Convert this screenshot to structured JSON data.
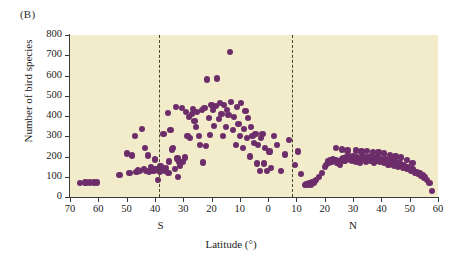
{
  "panel": {
    "label": "(B)"
  },
  "chart_data": {
    "type": "scatter",
    "title": "",
    "xlabel": "Latitude (°)",
    "ylabel": "Number of bird species",
    "xlim": [
      -70,
      60
    ],
    "ylim": [
      0,
      800
    ],
    "grid": false,
    "legend": null,
    "y_ticks": [
      0,
      100,
      200,
      300,
      400,
      500,
      600,
      700,
      800
    ],
    "x_ticks": [
      {
        "value": -70,
        "label": "70"
      },
      {
        "value": -60,
        "label": "60"
      },
      {
        "value": -50,
        "label": "50"
      },
      {
        "value": -40,
        "label": "40"
      },
      {
        "value": -30,
        "label": "30"
      },
      {
        "value": -20,
        "label": "20"
      },
      {
        "value": -10,
        "label": "10"
      },
      {
        "value": 0,
        "label": "0"
      },
      {
        "value": 10,
        "label": "10"
      },
      {
        "value": 20,
        "label": "20"
      },
      {
        "value": 30,
        "label": "30"
      },
      {
        "value": 40,
        "label": "40"
      },
      {
        "value": 50,
        "label": "50"
      },
      {
        "value": 60,
        "label": "60"
      }
    ],
    "hemisphere_labels": [
      {
        "text": "S",
        "value": -38
      },
      {
        "text": "N",
        "value": 30
      }
    ],
    "annotations": [
      {
        "type": "vline",
        "name": "tropic-south-line",
        "value": -38.5,
        "style": "dashed"
      },
      {
        "type": "vline",
        "name": "tropic-north-line",
        "value": 8.5,
        "style": "dashed"
      }
    ],
    "marker_color": "#6d2d6b",
    "plot_background": "#f3ecca",
    "points": [
      [
        -66.5,
        70
      ],
      [
        -64.5,
        72
      ],
      [
        -63.0,
        72
      ],
      [
        -61.5,
        72
      ],
      [
        -60.5,
        72
      ],
      [
        -52.5,
        108
      ],
      [
        -50.0,
        215
      ],
      [
        -49.0,
        118
      ],
      [
        -48.0,
        205
      ],
      [
        -47.0,
        300
      ],
      [
        -46.5,
        122
      ],
      [
        -46.0,
        135
      ],
      [
        -45.2,
        128
      ],
      [
        -44.5,
        335
      ],
      [
        -44.0,
        140
      ],
      [
        -43.5,
        240
      ],
      [
        -43.0,
        130
      ],
      [
        -42.5,
        205
      ],
      [
        -42.0,
        122
      ],
      [
        -41.5,
        150
      ],
      [
        -41.0,
        135
      ],
      [
        -40.5,
        128
      ],
      [
        -40.0,
        185
      ],
      [
        -39.8,
        140
      ],
      [
        -39.5,
        132
      ],
      [
        -39.0,
        85
      ],
      [
        -38.8,
        138
      ],
      [
        -38.5,
        130
      ],
      [
        -38.2,
        125
      ],
      [
        -38.0,
        155
      ],
      [
        -37.5,
        145
      ],
      [
        -37.2,
        132
      ],
      [
        -37.0,
        310
      ],
      [
        -36.5,
        128
      ],
      [
        -36.0,
        142
      ],
      [
        -35.5,
        415
      ],
      [
        -35.2,
        120
      ],
      [
        -35.0,
        175
      ],
      [
        -34.5,
        330
      ],
      [
        -34.0,
        235
      ],
      [
        -33.5,
        240
      ],
      [
        -33.0,
        140
      ],
      [
        -32.5,
        445
      ],
      [
        -32.0,
        190
      ],
      [
        -31.8,
        100
      ],
      [
        -31.5,
        175
      ],
      [
        -31.0,
        155
      ],
      [
        -30.5,
        440
      ],
      [
        -30.0,
        172
      ],
      [
        -29.5,
        195
      ],
      [
        -29.0,
        420
      ],
      [
        -28.5,
        300
      ],
      [
        -28.0,
        395
      ],
      [
        -27.5,
        290
      ],
      [
        -27.0,
        410
      ],
      [
        -26.5,
        435
      ],
      [
        -26.0,
        375
      ],
      [
        -25.5,
        345
      ],
      [
        -25.0,
        420
      ],
      [
        -24.5,
        300
      ],
      [
        -24.0,
        255
      ],
      [
        -23.5,
        430
      ],
      [
        -23.0,
        170
      ],
      [
        -22.5,
        440
      ],
      [
        -22.0,
        250
      ],
      [
        -21.5,
        580
      ],
      [
        -21.0,
        390
      ],
      [
        -20.5,
        305
      ],
      [
        -20.0,
        455
      ],
      [
        -19.5,
        430
      ],
      [
        -19.0,
        350
      ],
      [
        -18.5,
        450
      ],
      [
        -18.0,
        585
      ],
      [
        -17.5,
        385
      ],
      [
        -17.0,
        465
      ],
      [
        -16.5,
        410
      ],
      [
        -16.0,
        300
      ],
      [
        -15.5,
        455
      ],
      [
        -15.0,
        345
      ],
      [
        -14.5,
        430
      ],
      [
        -14.0,
        405
      ],
      [
        -13.5,
        715
      ],
      [
        -13.0,
        470
      ],
      [
        -12.5,
        330
      ],
      [
        -12.0,
        395
      ],
      [
        -11.5,
        255
      ],
      [
        -11.0,
        445
      ],
      [
        -10.5,
        360
      ],
      [
        -10.0,
        300
      ],
      [
        -9.5,
        465
      ],
      [
        -9.0,
        240
      ],
      [
        -8.5,
        335
      ],
      [
        -8.0,
        425
      ],
      [
        -7.5,
        290
      ],
      [
        -7.0,
        390
      ],
      [
        -6.5,
        200
      ],
      [
        -6.0,
        345
      ],
      [
        -5.5,
        300
      ],
      [
        -5.0,
        265
      ],
      [
        -4.5,
        310
      ],
      [
        -4.0,
        165
      ],
      [
        -3.5,
        255
      ],
      [
        -3.0,
        130
      ],
      [
        -2.5,
        290
      ],
      [
        -2.0,
        310
      ],
      [
        -1.5,
        165
      ],
      [
        -1.0,
        240
      ],
      [
        -0.5,
        128
      ],
      [
        0.5,
        225
      ],
      [
        1.0,
        145
      ],
      [
        2.0,
        300
      ],
      [
        3.0,
        255
      ],
      [
        4.5,
        130
      ],
      [
        6.0,
        210
      ],
      [
        7.5,
        280
      ],
      [
        9.5,
        160
      ],
      [
        10.5,
        225
      ],
      [
        11.5,
        115
      ],
      [
        13.0,
        60
      ],
      [
        13.5,
        62
      ],
      [
        14.0,
        58
      ],
      [
        14.5,
        70
      ],
      [
        15.0,
        62
      ],
      [
        15.5,
        75
      ],
      [
        16.0,
        70
      ],
      [
        16.5,
        80
      ],
      [
        17.0,
        85
      ],
      [
        18.0,
        100
      ],
      [
        19.0,
        120
      ],
      [
        20.0,
        150
      ],
      [
        20.5,
        160
      ],
      [
        21.0,
        175
      ],
      [
        21.5,
        168
      ],
      [
        22.0,
        180
      ],
      [
        22.5,
        172
      ],
      [
        23.0,
        185
      ],
      [
        23.5,
        178
      ],
      [
        24.0,
        182
      ],
      [
        24.5,
        170
      ],
      [
        25.0,
        175
      ],
      [
        25.5,
        160
      ],
      [
        26.0,
        185
      ],
      [
        26.5,
        192
      ],
      [
        27.0,
        180
      ],
      [
        27.5,
        195
      ],
      [
        28.0,
        188
      ],
      [
        28.5,
        200
      ],
      [
        29.0,
        185
      ],
      [
        29.5,
        178
      ],
      [
        30.0,
        200
      ],
      [
        30.5,
        190
      ],
      [
        31.0,
        175
      ],
      [
        31.5,
        195
      ],
      [
        32.0,
        185
      ],
      [
        32.5,
        170
      ],
      [
        33.0,
        190
      ],
      [
        33.5,
        200
      ],
      [
        34.0,
        188
      ],
      [
        34.5,
        175
      ],
      [
        35.0,
        195
      ],
      [
        35.5,
        185
      ],
      [
        36.0,
        178
      ],
      [
        36.5,
        200
      ],
      [
        37.0,
        190
      ],
      [
        37.5,
        170
      ],
      [
        38.0,
        185
      ],
      [
        38.5,
        195
      ],
      [
        39.0,
        180
      ],
      [
        39.5,
        172
      ],
      [
        40.0,
        188
      ],
      [
        40.5,
        178
      ],
      [
        41.0,
        168
      ],
      [
        41.5,
        185
      ],
      [
        42.0,
        175
      ],
      [
        42.5,
        160
      ],
      [
        43.0,
        172
      ],
      [
        43.5,
        180
      ],
      [
        44.0,
        165
      ],
      [
        44.5,
        155
      ],
      [
        45.0,
        170
      ],
      [
        45.5,
        160
      ],
      [
        46.0,
        150
      ],
      [
        46.5,
        165
      ],
      [
        47.0,
        155
      ],
      [
        47.5,
        145
      ],
      [
        48.0,
        158
      ],
      [
        48.5,
        148
      ],
      [
        49.0,
        140
      ],
      [
        49.5,
        150
      ],
      [
        50.0,
        138
      ],
      [
        50.5,
        128
      ],
      [
        51.0,
        140
      ],
      [
        51.5,
        130
      ],
      [
        52.0,
        118
      ],
      [
        52.5,
        125
      ],
      [
        53.0,
        112
      ],
      [
        53.5,
        118
      ],
      [
        54.0,
        105
      ],
      [
        54.5,
        110
      ],
      [
        55.0,
        95
      ],
      [
        55.5,
        100
      ],
      [
        56.0,
        85
      ],
      [
        57.0,
        70
      ],
      [
        58.0,
        30
      ],
      [
        24.0,
        240
      ],
      [
        26.0,
        235
      ],
      [
        28.0,
        230
      ],
      [
        31.0,
        230
      ],
      [
        33.0,
        225
      ],
      [
        35.0,
        228
      ],
      [
        37.0,
        222
      ],
      [
        39.0,
        220
      ],
      [
        41.0,
        215
      ],
      [
        43.0,
        208
      ],
      [
        45.0,
        200
      ],
      [
        47.0,
        195
      ],
      [
        49.0,
        182
      ],
      [
        51.0,
        168
      ]
    ]
  }
}
